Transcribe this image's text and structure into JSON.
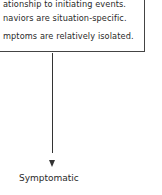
{
  "box": {
    "lines": [
      "ationship to initiating events.",
      "naviors are situation-specific.",
      "mptoms are relatively isolated."
    ]
  },
  "node": {
    "label": "Symptomatic"
  }
}
